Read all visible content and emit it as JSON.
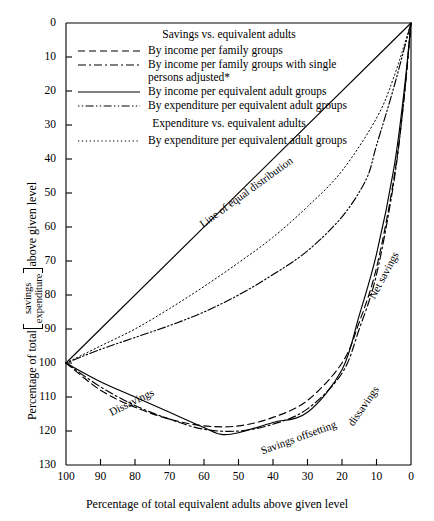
{
  "chart_data": {
    "type": "line",
    "title": "",
    "xlabel": "Percentage of total equivalent adults above given level",
    "ylabel": "Percentage of total savings/expenditure above given level",
    "xlim": [
      100,
      0
    ],
    "ylim": [
      0,
      130
    ],
    "xticks": [
      100,
      90,
      80,
      70,
      60,
      50,
      40,
      30,
      20,
      10,
      0
    ],
    "yticks": [
      0,
      10,
      20,
      30,
      40,
      50,
      60,
      70,
      80,
      90,
      100,
      110,
      120,
      130
    ],
    "grid": false,
    "legend_position": "top-center-inside",
    "series": [
      {
        "name": "Line of equal distribution",
        "style": "solid",
        "x": [
          100,
          0
        ],
        "y": [
          100,
          0
        ]
      },
      {
        "name": "By income per family groups",
        "style": "dashed",
        "x": [
          100,
          90,
          80,
          70,
          60,
          50,
          40,
          30,
          20,
          15,
          10,
          5,
          2,
          0
        ],
        "y": [
          100,
          108,
          113,
          116.5,
          118.5,
          118.5,
          116,
          111,
          100,
          88,
          72,
          46,
          22,
          0
        ]
      },
      {
        "name": "By income per family groups with single persons adjusted*",
        "style": "dashdot",
        "x": [
          100,
          90,
          80,
          70,
          60,
          50,
          40,
          30,
          20,
          15,
          10,
          5,
          2,
          0
        ],
        "y": [
          100,
          107,
          112.5,
          116.5,
          119.5,
          120,
          118,
          113.5,
          103,
          90,
          74,
          47,
          22,
          0
        ]
      },
      {
        "name": "By income per equivalent adult groups",
        "style": "solid",
        "x": [
          100,
          90,
          80,
          70,
          60,
          55,
          50,
          40,
          30,
          20,
          15,
          10,
          5,
          2,
          0
        ],
        "y": [
          100,
          105.5,
          110,
          114.5,
          119,
          121,
          120.5,
          117.5,
          114.5,
          102,
          86,
          68,
          43,
          20,
          0
        ]
      },
      {
        "name": "By expenditure per equivalent adult groups",
        "style": "dashdotdot",
        "x": [
          100,
          90,
          80,
          70,
          60,
          50,
          40,
          30,
          20,
          13,
          10,
          5,
          0
        ],
        "y": [
          100,
          96,
          92.5,
          89,
          85,
          80,
          74,
          67,
          57,
          46,
          36,
          19,
          0
        ]
      },
      {
        "name": "By expenditure per equivalent adult groups (expenditure vs. equivalent adults)",
        "style": "dotted",
        "x": [
          100,
          90,
          80,
          70,
          60,
          50,
          40,
          30,
          20,
          10,
          5,
          0
        ],
        "y": [
          100,
          95,
          90,
          84,
          77.5,
          70.5,
          63,
          54,
          43.5,
          28,
          16,
          0
        ]
      }
    ],
    "annotations": [
      {
        "text": "Line of equal distribution",
        "x": 62,
        "y": 58,
        "rotation": -36
      },
      {
        "text": "Dissavings",
        "x": 88,
        "y": 113,
        "rotation": -26
      },
      {
        "text": "Savings offsetting",
        "x": 44,
        "y": 124,
        "rotation": -20
      },
      {
        "text": "dissavings",
        "x": 19,
        "y": 117,
        "rotation": -55
      },
      {
        "text": "Net savings",
        "x": 13,
        "y": 80,
        "rotation": -62
      }
    ]
  },
  "axes": {
    "x_title": "Percentage of total equivalent adults above given level",
    "y_title_prefix": "Percentage of total",
    "y_frac_numerator": "savings",
    "y_frac_denominator": "expenditure",
    "y_title_suffix": "above given level",
    "x_tick_labels": [
      "100",
      "90",
      "80",
      "70",
      "60",
      "50",
      "40",
      "30",
      "20",
      "10",
      "0"
    ],
    "y_tick_labels": [
      "0",
      "10",
      "20",
      "30",
      "40",
      "50",
      "60",
      "70",
      "80",
      "90",
      "100",
      "110",
      "120",
      "130"
    ]
  },
  "legend": {
    "heading_1": "Savings vs. equivalent adults",
    "heading_2": "Expenditure vs. equivalent adults",
    "entries": [
      {
        "label": "By income per family groups",
        "style": "dashed"
      },
      {
        "label": "By income per family groups with single persons adjusted*",
        "style": "dashdot"
      },
      {
        "label": "By income per equivalent adult groups",
        "style": "solid"
      },
      {
        "label": "By expenditure per equivalent adult groups",
        "style": "dashdotdot"
      }
    ],
    "entries_2": [
      {
        "label": "By expenditure per equivalent adult groups",
        "style": "dotted"
      }
    ]
  },
  "annotations": {
    "line_of_equal_distribution": "Line of equal distribution",
    "dissavings": "Dissavings",
    "savings_offsetting": "Savings offsetting",
    "dissavings_2": "dissavings",
    "net_savings": "Net savings"
  },
  "colors": {
    "line": "#000000",
    "axis": "#000000",
    "background": "#ffffff"
  }
}
